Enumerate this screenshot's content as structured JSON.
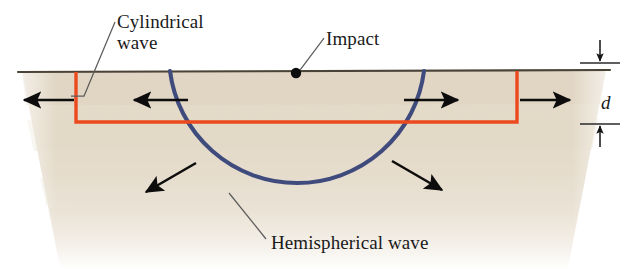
{
  "figure": {
    "labels": {
      "cylindrical_wave": "Cylindrical\nwave",
      "impact": "Impact",
      "hemispherical_wave": "Hemispherical wave",
      "depth": "d"
    },
    "colors": {
      "cylindrical_wave": "#ec4a1e",
      "hemispherical_wave": "#3f4a7d",
      "ground_fill": "#ded2bd",
      "surface_line": "#4a4438",
      "arrow": "#0d0d0d",
      "leader_line": "#5d5d5d",
      "background": "#ffffff",
      "label_text": "#1a1a1a"
    },
    "elements": {
      "impact_point_label": "impact-point",
      "ground_layer_label": "ground-medium",
      "surface_label": "ground-surface",
      "depth_marker_label": "depth-dimension-d"
    },
    "geometry": {
      "surface_y": 71,
      "layer_depth_px": 50,
      "impact_x": 296,
      "arc_center_x": 296,
      "arc_radius": 128
    }
  }
}
